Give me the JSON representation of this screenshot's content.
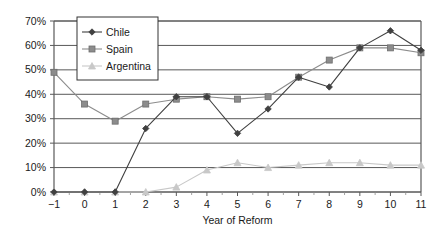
{
  "chart_data": {
    "type": "line",
    "title": "",
    "xlabel": "Year of Reform",
    "ylabel": "",
    "x": [
      -1,
      0,
      1,
      2,
      3,
      4,
      5,
      6,
      7,
      8,
      9,
      10,
      11
    ],
    "xticklabels": [
      "−1",
      "0",
      "1",
      "2",
      "3",
      "4",
      "5",
      "6",
      "7",
      "8",
      "9",
      "10",
      "11"
    ],
    "yticklabels": [
      "0%",
      "10%",
      "20%",
      "30%",
      "40%",
      "50%",
      "60%",
      "70%"
    ],
    "ytickvalues": [
      0,
      10,
      20,
      30,
      40,
      50,
      60,
      70
    ],
    "ylim": [
      0,
      70
    ],
    "xlim": [
      -1,
      11
    ],
    "grid": "horizontal",
    "legend_position": "top-left-inside",
    "series": [
      {
        "name": "Chile",
        "marker": "diamond",
        "color": "#404040",
        "values": [
          0,
          0,
          0,
          26,
          39,
          39,
          24,
          34,
          47,
          43,
          59,
          66,
          58
        ]
      },
      {
        "name": "Spain",
        "marker": "square",
        "color": "#8c8c8c",
        "values": [
          49,
          36,
          29,
          36,
          38,
          39,
          38,
          39,
          47,
          54,
          59,
          59,
          57
        ]
      },
      {
        "name": "Argentina",
        "marker": "triangle",
        "color": "#c8c8c8",
        "values": [
          0,
          0,
          0,
          0,
          2,
          9,
          12,
          10,
          11,
          12,
          12,
          11,
          11
        ]
      }
    ]
  },
  "legend": {
    "items": [
      {
        "label": "Chile"
      },
      {
        "label": "Spain"
      },
      {
        "label": "Argentina"
      }
    ]
  },
  "axes": {
    "x_title": "Year of Reform"
  }
}
